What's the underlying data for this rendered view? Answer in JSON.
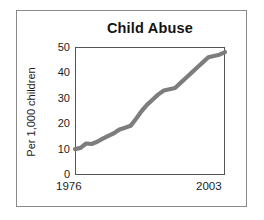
{
  "figure": {
    "title": "Child Abuse",
    "ylabel": "Per 1,000 children",
    "xticks": [
      "1976",
      "2003"
    ],
    "yticks": [
      "50",
      "40",
      "30",
      "20",
      "10",
      "0"
    ],
    "line_color": "#7d7d7d",
    "frame_color": "#8a8a8a",
    "background": "#ffffff"
  },
  "chart_data": {
    "type": "line",
    "title": "Child Abuse",
    "xlabel": "",
    "ylabel": "Per 1,000 children",
    "xlim": [
      1976,
      2003
    ],
    "ylim": [
      0,
      50
    ],
    "grid": false,
    "legend": null,
    "x": [
      1976,
      1977,
      1978,
      1979,
      1980,
      1981,
      1982,
      1983,
      1984,
      1985,
      1986,
      1987,
      1988,
      1989,
      1990,
      1991,
      1992,
      1993,
      1994,
      1995,
      1996,
      1997,
      1998,
      1999,
      2000,
      2001,
      2002,
      2003
    ],
    "values": [
      10.1,
      10.6,
      12.3,
      12.1,
      13.0,
      14.2,
      15.3,
      16.3,
      17.8,
      18.5,
      19.2,
      22.0,
      25.0,
      27.5,
      29.5,
      31.5,
      33.0,
      33.5,
      34.0,
      36.0,
      38.0,
      40.0,
      42.0,
      44.0,
      46.0,
      46.5,
      47.0,
      48.0
    ],
    "series": [
      {
        "name": "Child abuse reports per 1,000 children",
        "values": [
          10.1,
          10.6,
          12.3,
          12.1,
          13.0,
          14.2,
          15.3,
          16.3,
          17.8,
          18.5,
          19.2,
          22.0,
          25.0,
          27.5,
          29.5,
          31.5,
          33.0,
          33.5,
          34.0,
          36.0,
          38.0,
          40.0,
          42.0,
          44.0,
          46.0,
          46.5,
          47.0,
          48.0
        ]
      }
    ],
    "xticks": [
      1976,
      2003
    ],
    "xticklabels": [
      "1976",
      "2003"
    ],
    "yticks": [
      0,
      10,
      20,
      30,
      40,
      50
    ],
    "yticklabels": [
      "0",
      "10",
      "20",
      "30",
      "40",
      "50"
    ]
  }
}
